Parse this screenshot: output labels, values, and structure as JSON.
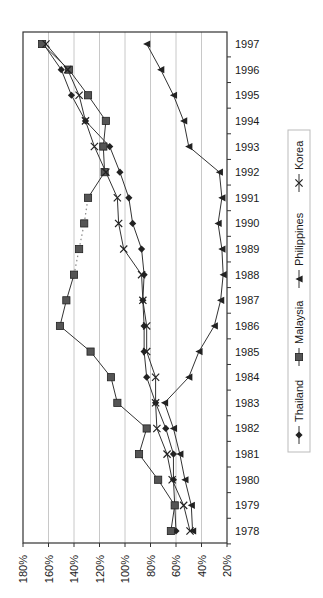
{
  "chart_data": {
    "type": "line",
    "orientation": "rotated-90-clockwise",
    "title": "",
    "xlabel": "",
    "ylabel": "",
    "x": [
      1978,
      1979,
      1980,
      1981,
      1982,
      1983,
      1984,
      1985,
      1986,
      1987,
      1988,
      1989,
      1990,
      1991,
      1992,
      1993,
      1994,
      1995,
      1996,
      1997
    ],
    "ylim": [
      20,
      180
    ],
    "y_ticks": [
      "180%",
      "160%",
      "140%",
      "120%",
      "100%",
      "80%",
      "60%",
      "40%",
      "20%"
    ],
    "y_tick_values": [
      180,
      160,
      140,
      120,
      100,
      80,
      60,
      40,
      20
    ],
    "grid": true,
    "legend_position": "right",
    "series": [
      {
        "name": "Thailand",
        "marker": "diamond",
        "values": [
          60,
          61,
          62,
          62,
          68,
          76,
          83,
          85,
          85,
          86,
          85,
          87,
          94,
          97,
          104,
          112,
          131,
          142,
          150,
          164
        ]
      },
      {
        "name": "Malaysia",
        "marker": "square",
        "dotted_segment": [
          1988,
          1991
        ],
        "values": [
          64,
          61,
          74,
          89,
          83,
          106,
          111,
          127,
          151,
          146,
          140,
          136,
          132,
          129,
          116,
          117,
          115,
          129,
          144,
          165
        ]
      },
      {
        "name": "Philippines",
        "marker": "triangle",
        "values": [
          47,
          48,
          53,
          57,
          62,
          69,
          50,
          42,
          30,
          25,
          23,
          24,
          27,
          24,
          26,
          50,
          54,
          62,
          72,
          83
        ]
      },
      {
        "name": "Korea",
        "marker": "x",
        "values": [
          49,
          54,
          63,
          67,
          75,
          76,
          76,
          83,
          83,
          86,
          87,
          101,
          105,
          106,
          115,
          124,
          131,
          136,
          145,
          162
        ]
      }
    ]
  },
  "colors": {
    "line": "#333333",
    "marker_fill": "#555555",
    "grid": "#c8c8c8",
    "axis": "#333333"
  }
}
